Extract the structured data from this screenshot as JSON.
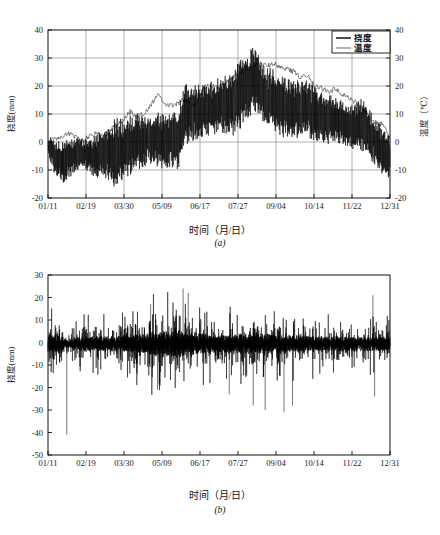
{
  "figure": {
    "panels": [
      {
        "id": "a",
        "caption": "(a)",
        "xlabel": "时间（月/日）",
        "ylabel_left": "挠度(mm)",
        "ylabel_right": "温度（℃）",
        "legend": [
          "挠度",
          "温度"
        ]
      },
      {
        "id": "b",
        "caption": "(b)",
        "xlabel": "时间（月/日）",
        "ylabel_left": "挠度(mm)"
      }
    ]
  },
  "chart_data": [
    {
      "type": "line",
      "panel": "a",
      "title": "",
      "xlabel": "时间（月/日）",
      "ylabel": "挠度(mm)",
      "ylabel_secondary": "温度（℃）",
      "xticklabels": [
        "01/11",
        "02/19",
        "03/30",
        "05/09",
        "06/17",
        "07/27",
        "09/04",
        "10/14",
        "11/22",
        "12/31"
      ],
      "yticks": [
        -20,
        -10,
        0,
        10,
        20,
        30,
        40
      ],
      "ylim": [
        -20,
        40
      ],
      "yticks_secondary": [
        -20,
        -10,
        0,
        10,
        20,
        30,
        40
      ],
      "ylim_secondary": [
        -20,
        40
      ],
      "grid": true,
      "legend": [
        "挠度",
        "温度"
      ],
      "legend_position": "top-right",
      "series": [
        {
          "name": "挠度",
          "description": "dense noisy daily deflection band, mm",
          "style": "thick-noisy",
          "color": "#000000",
          "envelope_x": [
            0,
            0.01,
            0.02,
            0.04,
            0.06,
            0.08,
            0.1,
            0.12,
            0.14,
            0.16,
            0.18,
            0.2,
            0.22,
            0.24,
            0.26,
            0.28,
            0.3,
            0.32,
            0.34,
            0.36,
            0.38,
            0.4,
            0.42,
            0.44,
            0.46,
            0.48,
            0.5,
            0.52,
            0.54,
            0.56,
            0.58,
            0.6,
            0.62,
            0.64,
            0.66,
            0.68,
            0.7,
            0.72,
            0.74,
            0.76,
            0.78,
            0.8,
            0.82,
            0.84,
            0.86,
            0.88,
            0.9,
            0.92,
            0.94,
            0.96,
            0.98,
            1.0
          ],
          "envelope_max": [
            1,
            2,
            1,
            0,
            1,
            2,
            2,
            1,
            3,
            4,
            6,
            9,
            8,
            10,
            11,
            10,
            9,
            11,
            10,
            12,
            11,
            21,
            20,
            21,
            20,
            22,
            23,
            24,
            24,
            30,
            31,
            35,
            30,
            27,
            26,
            24,
            23,
            22,
            23,
            22,
            20,
            18,
            17,
            16,
            15,
            13,
            14,
            16,
            12,
            8,
            5,
            2
          ],
          "envelope_min": [
            -4,
            -8,
            -12,
            -15,
            -13,
            -11,
            -9,
            -11,
            -13,
            -12,
            -14,
            -17,
            -14,
            -12,
            -10,
            -9,
            -8,
            -9,
            -10,
            -9,
            -10,
            -2,
            0,
            1,
            2,
            2,
            3,
            3,
            2,
            4,
            7,
            10,
            8,
            6,
            4,
            2,
            1,
            0,
            2,
            1,
            0,
            -1,
            -1,
            0,
            -1,
            -2,
            -3,
            -4,
            -6,
            -9,
            -12,
            -13
          ]
        },
        {
          "name": "温度",
          "description": "smooth seasonal air temperature curve, degC",
          "style": "thin-smooth",
          "color": "#000000",
          "x": [
            0,
            0.02,
            0.04,
            0.06,
            0.08,
            0.1,
            0.12,
            0.14,
            0.16,
            0.18,
            0.2,
            0.22,
            0.24,
            0.26,
            0.28,
            0.3,
            0.32,
            0.34,
            0.36,
            0.38,
            0.4,
            0.42,
            0.44,
            0.46,
            0.48,
            0.5,
            0.52,
            0.54,
            0.56,
            0.58,
            0.6,
            0.62,
            0.64,
            0.66,
            0.68,
            0.7,
            0.72,
            0.74,
            0.76,
            0.78,
            0.8,
            0.82,
            0.84,
            0.86,
            0.88,
            0.9,
            0.92,
            0.94,
            0.96,
            0.98,
            1.0
          ],
          "y": [
            0,
            1,
            2,
            3,
            2,
            1,
            2,
            3,
            2,
            4,
            6,
            8,
            11,
            9,
            10,
            13,
            17,
            14,
            13,
            14,
            15,
            13,
            15,
            20,
            20,
            19,
            21,
            23,
            25,
            26,
            27,
            28,
            27,
            28,
            27,
            26,
            25,
            23,
            24,
            20,
            19,
            18,
            19,
            17,
            16,
            14,
            12,
            9,
            7,
            6,
            1
          ]
        }
      ]
    },
    {
      "type": "line",
      "panel": "b",
      "title": "",
      "xlabel": "时间（月/日）",
      "ylabel": "挠度(mm)",
      "xticklabels": [
        "01/11",
        "02/19",
        "03/30",
        "05/09",
        "06/17",
        "07/27",
        "09/04",
        "10/14",
        "11/22",
        "12/31"
      ],
      "yticks": [
        -50,
        -40,
        -30,
        -20,
        -10,
        0,
        10,
        20,
        30
      ],
      "ylim": [
        -50,
        30
      ],
      "grid": false,
      "series": [
        {
          "name": "挠度残差",
          "description": "high-frequency residual deflection noise about zero, mm",
          "style": "dense-noise",
          "color": "#000000",
          "baseline": 0,
          "typical_band": [
            -5,
            4
          ],
          "spike_max": 24,
          "spike_min": -41,
          "notable_spikes": [
            {
              "x": 0.055,
              "y": -41
            },
            {
              "x": 0.3,
              "y": 17
            },
            {
              "x": 0.32,
              "y": -21
            },
            {
              "x": 0.395,
              "y": 24
            },
            {
              "x": 0.41,
              "y": 22
            },
            {
              "x": 0.53,
              "y": -23
            },
            {
              "x": 0.6,
              "y": -28
            },
            {
              "x": 0.635,
              "y": -30
            },
            {
              "x": 0.69,
              "y": -31
            },
            {
              "x": 0.715,
              "y": -28
            },
            {
              "x": 0.95,
              "y": 21
            },
            {
              "x": 0.955,
              "y": -24
            }
          ]
        }
      ]
    }
  ]
}
